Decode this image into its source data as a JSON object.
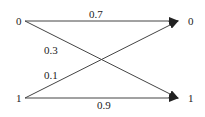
{
  "diagram": {
    "type": "binary-channel",
    "inputs": [
      {
        "id": "in0",
        "label": "0"
      },
      {
        "id": "in1",
        "label": "1"
      }
    ],
    "outputs": [
      {
        "id": "out0",
        "label": "0"
      },
      {
        "id": "out1",
        "label": "1"
      }
    ],
    "edges": [
      {
        "from": "in0",
        "to": "out0",
        "label": "0.7"
      },
      {
        "from": "in0",
        "to": "out1",
        "label": "0.3"
      },
      {
        "from": "in1",
        "to": "out0",
        "label": "0.1"
      },
      {
        "from": "in1",
        "to": "out1",
        "label": "0.9"
      }
    ],
    "colors": {
      "line": "#444444",
      "text": "#222222"
    }
  }
}
